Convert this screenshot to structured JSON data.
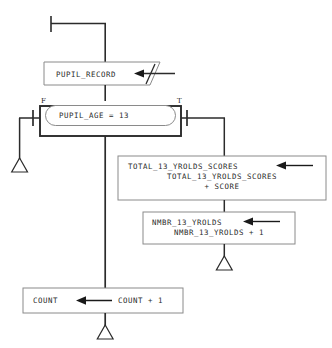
{
  "diagram": {
    "type": "nassi-shneiderman-style-flowchart",
    "title_text": "",
    "colors": {
      "box_border_gray": "#8a8a8a",
      "line_dark": "#2b2b2b",
      "text": "#2b2b2b",
      "background": "#ffffff"
    },
    "entry": {
      "name": "entry-bar",
      "label": ""
    },
    "nodes": [
      {
        "id": "read-pupil-record",
        "shape": "input-parallelogram",
        "lines": [
          "PUPIL_RECORD"
        ],
        "has_assign_arrow": true,
        "arrow_direction": "left"
      },
      {
        "id": "decision-pupil-age",
        "shape": "stadium-in-rect",
        "lines": [
          "PUPIL_AGE = 13"
        ],
        "false_label": "F",
        "true_label": "T"
      },
      {
        "id": "total-13-yrolds-scores",
        "shape": "rectangle",
        "lines": [
          "TOTAL_13_YROLDS_SCORES",
          "TOTAL_13_YROLDS_SCORES",
          "+ SCORE"
        ],
        "has_assign_arrow": true,
        "arrow_direction": "left"
      },
      {
        "id": "nmbr-13-yrolds",
        "shape": "rectangle",
        "lines": [
          "NMBR_13_YROLDS",
          "NMBR_13_YROLDS + 1"
        ],
        "has_assign_arrow": true,
        "arrow_direction": "left"
      },
      {
        "id": "count",
        "shape": "rectangle",
        "lines": [
          "COUNT",
          "COUNT + 1"
        ],
        "has_assign_arrow": true,
        "arrow_direction": "left"
      }
    ],
    "terminators": [
      {
        "id": "terminator-false-branch",
        "glyph": "hollow-triangle"
      },
      {
        "id": "terminator-true-branch",
        "glyph": "hollow-triangle"
      },
      {
        "id": "terminator-main-exit",
        "glyph": "hollow-triangle"
      }
    ]
  }
}
